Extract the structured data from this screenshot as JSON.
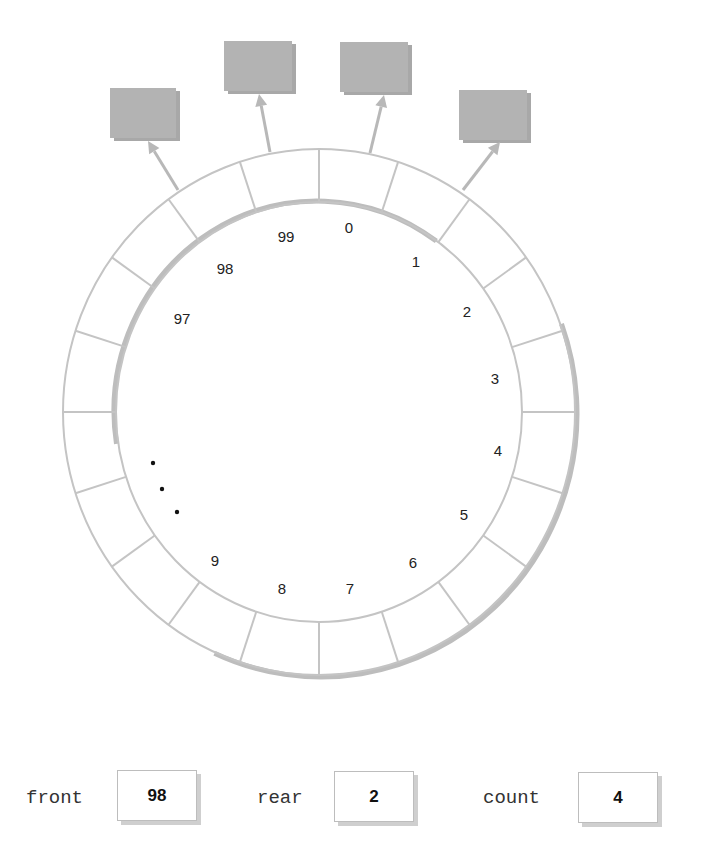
{
  "figure": {
    "ring": {
      "center": [
        319,
        412
      ],
      "outer_radii": [
        256,
        263
      ],
      "inner_radii": [
        203,
        210
      ],
      "segments": 20,
      "line_color": "#c4c4c4",
      "shadow_color": "#bdbdbd"
    },
    "slot_labels": [
      {
        "text": "0",
        "x": 349,
        "y": 233
      },
      {
        "text": "1",
        "x": 416,
        "y": 267
      },
      {
        "text": "2",
        "x": 467,
        "y": 317
      },
      {
        "text": "3",
        "x": 495,
        "y": 384
      },
      {
        "text": "4",
        "x": 498,
        "y": 456
      },
      {
        "text": "5",
        "x": 464,
        "y": 520
      },
      {
        "text": "6",
        "x": 413,
        "y": 568
      },
      {
        "text": "7",
        "x": 350,
        "y": 594
      },
      {
        "text": "8",
        "x": 282,
        "y": 594
      },
      {
        "text": "9",
        "x": 215,
        "y": 566
      },
      {
        "text": "97",
        "x": 182,
        "y": 324
      },
      {
        "text": "98",
        "x": 225,
        "y": 274
      },
      {
        "text": "99",
        "x": 286,
        "y": 242
      }
    ],
    "ellipsis_dots": [
      [
        153,
        463
      ],
      [
        162,
        489
      ],
      [
        177,
        512
      ]
    ],
    "element_boxes": [
      {
        "x": 110,
        "y": 88,
        "w": 66,
        "h": 50,
        "arrow_from": [
          178,
          190
        ],
        "arrow_to": [
          148,
          141
        ]
      },
      {
        "x": 224,
        "y": 41,
        "w": 68,
        "h": 50,
        "arrow_from": [
          270,
          152
        ],
        "arrow_to": [
          259,
          94
        ]
      },
      {
        "x": 340,
        "y": 42,
        "w": 68,
        "h": 50,
        "arrow_from": [
          370,
          153
        ],
        "arrow_to": [
          384,
          95
        ]
      },
      {
        "x": 459,
        "y": 90,
        "w": 68,
        "h": 50,
        "arrow_from": [
          463,
          190
        ],
        "arrow_to": [
          500,
          142
        ]
      }
    ],
    "box_fill": "#b3b3b3",
    "box_shadow": "#a8a8a8"
  },
  "variables": {
    "front": {
      "label": "front",
      "value": "98"
    },
    "rear": {
      "label": "rear",
      "value": "2"
    },
    "count": {
      "label": "count",
      "value": "4"
    }
  }
}
